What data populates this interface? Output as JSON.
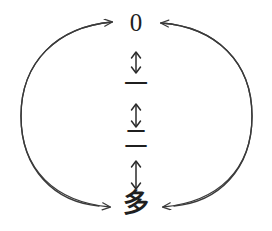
{
  "diagram": {
    "type": "cycle-diagram",
    "background_color": "#ffffff",
    "stroke_color": "#3a3a3a",
    "text_color": "#1f1f1f",
    "nodes": [
      {
        "id": "zero",
        "label": "0"
      },
      {
        "id": "one",
        "label": "一"
      },
      {
        "id": "two",
        "label": "二"
      },
      {
        "id": "many",
        "label": "多"
      }
    ],
    "vertical_connectors": [
      {
        "id": "zero-one",
        "glyph": "double-headed-vertical-arrow",
        "from": "zero",
        "to": "one"
      },
      {
        "id": "one-two",
        "glyph": "double-headed-vertical-arrow",
        "from": "one",
        "to": "two"
      },
      {
        "id": "two-many",
        "glyph": "double-headed-vertical-arrow",
        "from": "two",
        "to": "many"
      }
    ],
    "arcs": [
      {
        "id": "left-arc-up",
        "side": "left",
        "direction": "up",
        "from": "many",
        "to": "zero",
        "arrowhead": "right"
      },
      {
        "id": "left-arc-down",
        "side": "left",
        "direction": "down",
        "from": "zero",
        "to": "many",
        "arrowhead": "right"
      },
      {
        "id": "right-arc-up",
        "side": "right",
        "direction": "up",
        "from": "many",
        "to": "zero",
        "arrowhead": "left"
      },
      {
        "id": "right-arc-down",
        "side": "right",
        "direction": "down",
        "from": "zero",
        "to": "many",
        "arrowhead": "left"
      }
    ]
  }
}
